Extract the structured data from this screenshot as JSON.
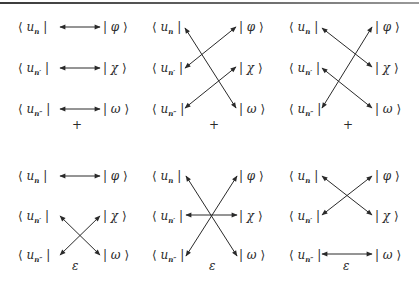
{
  "figure": {
    "bras": [
      {
        "id": "n",
        "text": "u",
        "sub": "n"
      },
      {
        "id": "n1",
        "text": "u",
        "sub": "n′"
      },
      {
        "id": "n2",
        "text": "u",
        "sub": "n″"
      }
    ],
    "kets": [
      "φ",
      "χ",
      "ω"
    ],
    "panels": [
      {
        "name": "top-1",
        "connections": [
          [
            "n",
            "φ"
          ],
          [
            "n1",
            "χ"
          ],
          [
            "n2",
            "ω"
          ]
        ],
        "symbol": "+"
      },
      {
        "name": "top-2",
        "connections": [
          [
            "n",
            "ω"
          ],
          [
            "n1",
            "φ"
          ],
          [
            "n2",
            "χ"
          ]
        ],
        "symbol": "+"
      },
      {
        "name": "top-3",
        "connections": [
          [
            "n",
            "χ"
          ],
          [
            "n1",
            "ω"
          ],
          [
            "n2",
            "φ"
          ]
        ],
        "symbol": "+"
      },
      {
        "name": "bottom-1",
        "connections": [
          [
            "n",
            "φ"
          ],
          [
            "n1",
            "ω"
          ],
          [
            "n2",
            "χ"
          ]
        ],
        "symbol": "ε"
      },
      {
        "name": "bottom-2",
        "connections": [
          [
            "n",
            "ω"
          ],
          [
            "n1",
            "χ"
          ],
          [
            "n2",
            "φ"
          ]
        ],
        "symbol": "ε"
      },
      {
        "name": "bottom-3",
        "connections": [
          [
            "n",
            "χ"
          ],
          [
            "n1",
            "φ"
          ],
          [
            "n2",
            "ω"
          ]
        ],
        "symbol": "ε"
      }
    ]
  },
  "labels": {
    "open_bracket": "⟨",
    "close_bracket": "⟩",
    "bar": "|",
    "plus": "+",
    "epsilon": "ε"
  }
}
